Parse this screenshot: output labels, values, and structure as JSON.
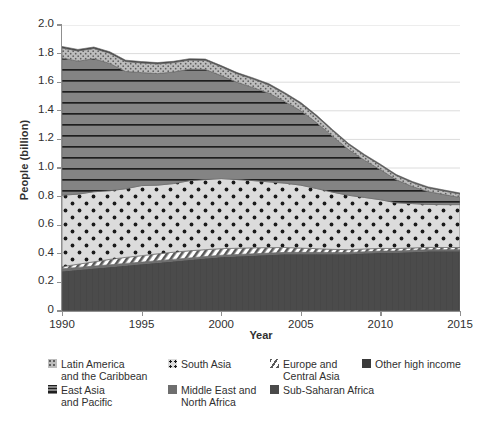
{
  "chart_data": {
    "type": "area",
    "stacked": true,
    "title": "",
    "xlabel": "Year",
    "ylabel": "People (billion)",
    "xlim": [
      1990,
      2015
    ],
    "ylim": [
      0,
      2.0
    ],
    "xticks": [
      1990,
      1995,
      2000,
      2005,
      2010,
      2015
    ],
    "yticks": [
      "0",
      "0.2",
      "0.4",
      "0.6",
      "0.8",
      "1.0",
      "1.2",
      "1.4",
      "1.6",
      "1.8",
      "2.0"
    ],
    "ytick_values": [
      0,
      0.2,
      0.4,
      0.6,
      0.8,
      1.0,
      1.2,
      1.4,
      1.6,
      1.8,
      2.0
    ],
    "grid": "horizontal",
    "legend_position": "bottom",
    "x": [
      1990,
      1991,
      1992,
      1993,
      1994,
      1995,
      1996,
      1997,
      1998,
      1999,
      2000,
      2001,
      2002,
      2003,
      2004,
      2005,
      2006,
      2007,
      2008,
      2009,
      2010,
      2011,
      2012,
      2013,
      2014,
      2015
    ],
    "series": [
      {
        "name": "Sub-Saharan Africa",
        "color": "#4a4a4a",
        "pattern": "solid-dark",
        "values": [
          0.28,
          0.29,
          0.3,
          0.31,
          0.32,
          0.33,
          0.34,
          0.35,
          0.36,
          0.37,
          0.38,
          0.385,
          0.39,
          0.395,
          0.4,
          0.4,
          0.4,
          0.4,
          0.4,
          0.405,
          0.41,
          0.41,
          0.415,
          0.42,
          0.42,
          0.42
        ]
      },
      {
        "name": "Middle East and North Africa",
        "color": "#6e6e6e",
        "pattern": "solid-medium",
        "values": [
          0.015,
          0.015,
          0.014,
          0.013,
          0.013,
          0.012,
          0.012,
          0.011,
          0.011,
          0.011,
          0.01,
          0.01,
          0.01,
          0.01,
          0.01,
          0.01,
          0.01,
          0.009,
          0.009,
          0.009,
          0.009,
          0.009,
          0.009,
          0.009,
          0.009,
          0.009
        ]
      },
      {
        "name": "Europe and Central Asia",
        "color": "#ffffff",
        "pattern": "diagonal-hatch",
        "values": [
          0.015,
          0.022,
          0.03,
          0.038,
          0.042,
          0.045,
          0.048,
          0.05,
          0.05,
          0.048,
          0.046,
          0.044,
          0.042,
          0.038,
          0.034,
          0.03,
          0.026,
          0.022,
          0.02,
          0.02,
          0.019,
          0.018,
          0.017,
          0.016,
          0.015,
          0.015
        ]
      },
      {
        "name": "South Asia",
        "color": "#d6d6d6",
        "pattern": "dotted-large",
        "values": [
          0.5,
          0.49,
          0.49,
          0.48,
          0.48,
          0.49,
          0.48,
          0.48,
          0.49,
          0.49,
          0.49,
          0.48,
          0.47,
          0.46,
          0.45,
          0.44,
          0.42,
          0.4,
          0.38,
          0.36,
          0.34,
          0.32,
          0.31,
          0.3,
          0.3,
          0.3
        ]
      },
      {
        "name": "East Asia and Pacific",
        "color": "#7d7d7d",
        "pattern": "horizontal-lines",
        "values": [
          0.96,
          0.93,
          0.93,
          0.89,
          0.82,
          0.79,
          0.78,
          0.78,
          0.78,
          0.77,
          0.72,
          0.68,
          0.65,
          0.62,
          0.57,
          0.52,
          0.46,
          0.39,
          0.32,
          0.26,
          0.21,
          0.16,
          0.12,
          0.09,
          0.07,
          0.05
        ]
      },
      {
        "name": "Latin America and the Caribbean",
        "color": "#b9b9b9",
        "pattern": "dotted-fine",
        "values": [
          0.07,
          0.072,
          0.072,
          0.072,
          0.07,
          0.068,
          0.068,
          0.066,
          0.064,
          0.064,
          0.062,
          0.06,
          0.06,
          0.058,
          0.055,
          0.05,
          0.045,
          0.04,
          0.036,
          0.034,
          0.032,
          0.03,
          0.028,
          0.026,
          0.025,
          0.024
        ]
      },
      {
        "name": "Other high income",
        "color": "#3a3a3a",
        "pattern": "solid-darkest",
        "values": [
          0.01,
          0.01,
          0.01,
          0.01,
          0.009,
          0.009,
          0.009,
          0.009,
          0.009,
          0.009,
          0.008,
          0.008,
          0.008,
          0.008,
          0.008,
          0.008,
          0.008,
          0.007,
          0.007,
          0.007,
          0.007,
          0.007,
          0.007,
          0.007,
          0.007,
          0.007
        ]
      }
    ],
    "totals": [
      1.85,
      1.83,
      1.84,
      1.79,
      1.7,
      1.69,
      1.67,
      1.66,
      1.66,
      1.65,
      1.57,
      1.51,
      1.46,
      1.41,
      1.33,
      1.25,
      1.17,
      1.08,
      0.99,
      0.93,
      0.86,
      0.8,
      0.76,
      0.72,
      0.69,
      0.67
    ]
  },
  "axes": {
    "ylabel": "People (billion)",
    "xlabel": "Year",
    "ytick_labels": [
      "2.0",
      "1.8",
      "1.6",
      "1.4",
      "1.2",
      "1.0",
      "0.8",
      "0.6",
      "0.4",
      "0.2",
      "0"
    ],
    "xtick_labels": [
      "1990",
      "1995",
      "2000",
      "2005",
      "2010",
      "2015"
    ]
  },
  "legend": {
    "items": [
      {
        "label": "Latin America\nand the Caribbean",
        "swatch": "sw-latin",
        "icon": "legend-swatch-latin-america"
      },
      {
        "label": "South Asia",
        "swatch": "sw-southasia",
        "icon": "legend-swatch-south-asia"
      },
      {
        "label": "Europe and\nCentral Asia",
        "swatch": "sw-europe",
        "icon": "legend-swatch-europe-central-asia"
      },
      {
        "label": "Other high income",
        "swatch": "sw-other",
        "icon": "legend-swatch-other-high-income"
      },
      {
        "label": "East Asia\nand Pacific",
        "swatch": "sw-eastasia",
        "icon": "legend-swatch-east-asia-pacific"
      },
      {
        "label": "Middle East and\nNorth Africa",
        "swatch": "sw-mena",
        "icon": "legend-swatch-middle-east-north-africa"
      },
      {
        "label": "Sub-Saharan Africa",
        "swatch": "sw-ssa",
        "icon": "legend-swatch-sub-saharan-africa"
      }
    ]
  }
}
